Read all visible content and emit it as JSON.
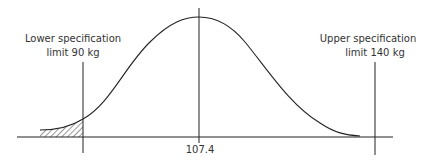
{
  "diagram": {
    "type": "normal-distribution-with-specification-limits",
    "lower_limit": {
      "line1": "Lower specification",
      "line2": "limit 90 kg",
      "value": 90,
      "unit": "kg"
    },
    "upper_limit": {
      "line1": "Upper specification",
      "line2": "limit 140 kg",
      "value": 140,
      "unit": "kg"
    },
    "mean": {
      "label": "107.4",
      "value": 107.4
    },
    "shaded_region": "area below lower specification limit",
    "colors": {
      "line": "#222222",
      "text": "#333333",
      "background": "#ffffff"
    }
  }
}
